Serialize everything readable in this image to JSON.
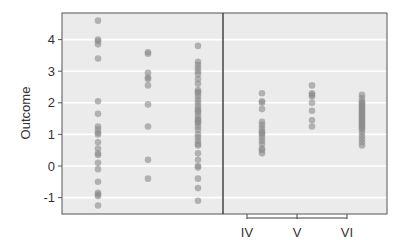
{
  "chart_data": {
    "type": "scatter",
    "title": "",
    "xlabel": "",
    "ylabel": "Outcome",
    "ylim": [
      -1.45,
      4.85
    ],
    "yticks": [
      -1,
      0,
      1,
      2,
      3,
      4
    ],
    "grid": true,
    "panels": [
      {
        "name": "left",
        "categories": [
          "",
          "",
          ""
        ],
        "series": [
          {
            "name": "group-1",
            "values": [
              4.6,
              4.0,
              3.95,
              3.85,
              3.4,
              2.05,
              1.65,
              1.25,
              1.15,
              1.05,
              1.0,
              0.75,
              0.55,
              0.4,
              0.35,
              0.1,
              -0.1,
              -0.5,
              -0.85,
              -0.95,
              -0.9,
              -1.25
            ]
          },
          {
            "name": "group-2",
            "values": [
              3.6,
              3.55,
              2.95,
              2.8,
              2.75,
              2.55,
              1.95,
              1.25,
              0.2,
              -0.4
            ]
          },
          {
            "name": "group-3",
            "values": [
              3.8,
              3.3,
              3.2,
              3.1,
              3.0,
              2.9,
              2.75,
              2.6,
              2.4,
              2.35,
              2.3,
              2.2,
              2.1,
              2.0,
              1.9,
              1.8,
              1.75,
              1.7,
              1.6,
              1.5,
              1.45,
              1.4,
              1.35,
              1.25,
              1.15,
              1.0,
              0.9,
              0.8,
              0.7,
              0.65,
              0.4,
              0.2,
              0.0,
              -0.05,
              -0.4,
              -0.7,
              -1.1
            ]
          }
        ]
      },
      {
        "name": "right",
        "categories": [
          "IV",
          "V",
          "VI"
        ],
        "series": [
          {
            "name": "IV",
            "values": [
              2.3,
              2.05,
              2.0,
              1.8,
              1.4,
              1.3,
              1.2,
              1.1,
              1.05,
              1.0,
              0.9,
              0.8,
              0.7,
              0.55,
              0.5,
              0.4
            ]
          },
          {
            "name": "V",
            "values": [
              2.55,
              2.3,
              2.25,
              2.2,
              2.0,
              1.75,
              1.45,
              1.25
            ]
          },
          {
            "name": "VI",
            "values": [
              2.25,
              2.15,
              2.05,
              2.0,
              1.95,
              1.9,
              1.85,
              1.8,
              1.75,
              1.7,
              1.65,
              1.6,
              1.55,
              1.5,
              1.45,
              1.4,
              1.35,
              1.3,
              1.25,
              1.2,
              1.15,
              1.05,
              0.95,
              0.85,
              0.75,
              0.65
            ]
          }
        ]
      }
    ],
    "colors": {
      "panel_bg": "#ebebeb",
      "grid": "#ffffff",
      "point": "#8a8a8a",
      "axis": "#555555"
    }
  },
  "axis": {
    "ylabel": "Outcome",
    "yticks": [
      "-1",
      "0",
      "1",
      "2",
      "3",
      "4"
    ],
    "xticks_right": [
      "IV",
      "V",
      "VI"
    ]
  }
}
